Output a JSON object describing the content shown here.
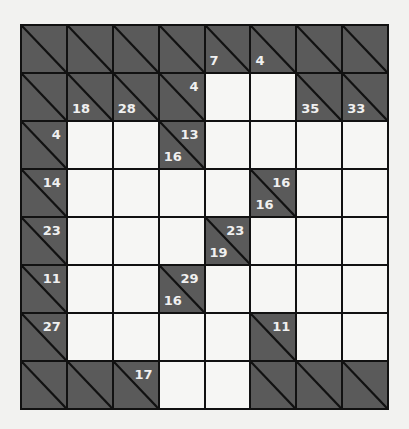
{
  "puzzle": {
    "type": "kakuro",
    "rows": 8,
    "cols": 8,
    "colors": {
      "clue_cell": "#5a5a5a",
      "white_cell": "#f6f6f4",
      "grid_line": "#111111",
      "clue_text": "#f0f0f0",
      "background": "#f2f2f0"
    },
    "grid": [
      [
        {
          "t": "clue"
        },
        {
          "t": "clue"
        },
        {
          "t": "clue"
        },
        {
          "t": "clue"
        },
        {
          "t": "clue",
          "down": "7"
        },
        {
          "t": "clue",
          "down": "4"
        },
        {
          "t": "clue"
        },
        {
          "t": "clue"
        }
      ],
      [
        {
          "t": "clue"
        },
        {
          "t": "clue",
          "down": "18"
        },
        {
          "t": "clue",
          "down": "28"
        },
        {
          "t": "clue",
          "across": "4"
        },
        {
          "t": "white"
        },
        {
          "t": "white"
        },
        {
          "t": "clue",
          "down": "35"
        },
        {
          "t": "clue",
          "down": "33"
        }
      ],
      [
        {
          "t": "clue",
          "across": "4"
        },
        {
          "t": "white"
        },
        {
          "t": "white"
        },
        {
          "t": "clue",
          "across": "13",
          "down": "16"
        },
        {
          "t": "white"
        },
        {
          "t": "white"
        },
        {
          "t": "white"
        },
        {
          "t": "white"
        }
      ],
      [
        {
          "t": "clue",
          "across": "14"
        },
        {
          "t": "white"
        },
        {
          "t": "white"
        },
        {
          "t": "white"
        },
        {
          "t": "white"
        },
        {
          "t": "clue",
          "across": "16",
          "down": "16"
        },
        {
          "t": "white"
        },
        {
          "t": "white"
        }
      ],
      [
        {
          "t": "clue",
          "across": "23"
        },
        {
          "t": "white"
        },
        {
          "t": "white"
        },
        {
          "t": "white"
        },
        {
          "t": "clue",
          "across": "23",
          "down": "19"
        },
        {
          "t": "white"
        },
        {
          "t": "white"
        },
        {
          "t": "white"
        }
      ],
      [
        {
          "t": "clue",
          "across": "11"
        },
        {
          "t": "white"
        },
        {
          "t": "white"
        },
        {
          "t": "clue",
          "across": "29",
          "down": "16"
        },
        {
          "t": "white"
        },
        {
          "t": "white"
        },
        {
          "t": "white"
        },
        {
          "t": "white"
        }
      ],
      [
        {
          "t": "clue",
          "across": "27"
        },
        {
          "t": "white"
        },
        {
          "t": "white"
        },
        {
          "t": "white"
        },
        {
          "t": "white"
        },
        {
          "t": "clue",
          "across": "11"
        },
        {
          "t": "white"
        },
        {
          "t": "white"
        }
      ],
      [
        {
          "t": "clue"
        },
        {
          "t": "clue"
        },
        {
          "t": "clue",
          "across": "17"
        },
        {
          "t": "white"
        },
        {
          "t": "white"
        },
        {
          "t": "clue"
        },
        {
          "t": "clue"
        },
        {
          "t": "clue"
        }
      ]
    ]
  }
}
